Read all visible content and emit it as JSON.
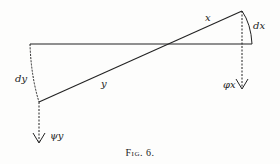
{
  "figure": {
    "caption": "Fig. 6.",
    "labels": {
      "x": "x",
      "y": "y",
      "dx": "dx",
      "dy": "dy",
      "phi_x": "φx",
      "psi_y": "ψy"
    },
    "colors": {
      "ink": "#222222",
      "background": "#fdfdfc"
    }
  }
}
